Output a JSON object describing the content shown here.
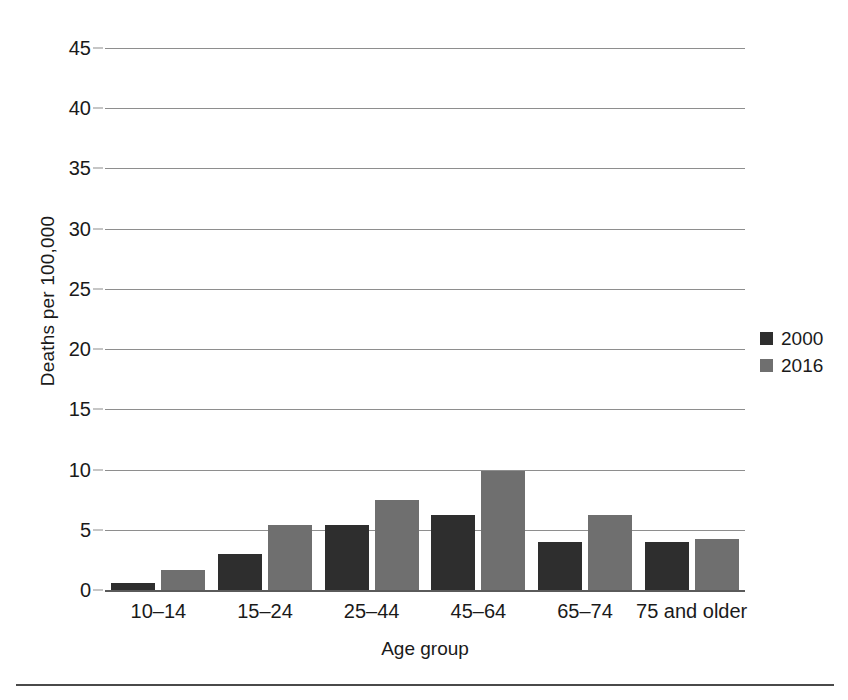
{
  "chart_data": {
    "type": "bar",
    "title": "",
    "xlabel": "Age group",
    "ylabel": "Deaths per 100,000",
    "categories": [
      "10–14",
      "15–24",
      "25–44",
      "45–64",
      "65–74",
      "75 and older"
    ],
    "series": [
      {
        "name": "2000",
        "color": "#2e2e2e",
        "values": [
          0.6,
          3.0,
          5.4,
          6.2,
          4.0,
          4.0
        ]
      },
      {
        "name": "2016",
        "color": "#6f6f6f",
        "values": [
          1.7,
          5.4,
          7.5,
          9.9,
          6.2,
          4.2
        ]
      }
    ],
    "ylim": [
      0,
      45
    ],
    "ytick_values": [
      0,
      5,
      10,
      15,
      20,
      25,
      30,
      35,
      40,
      45
    ],
    "ytick_labels": [
      "0",
      "5",
      "10",
      "15",
      "20",
      "25",
      "30",
      "35",
      "40",
      "45"
    ],
    "grid": true,
    "grid_axis": "y",
    "legend_position": "right",
    "legend_entries": [
      "2000",
      "2016"
    ]
  },
  "figure": {
    "background_color": "#ffffff",
    "gridline_color": "#8e8e8e",
    "axis_color": "#5a5a5a",
    "text_color": "#1a1a1a",
    "bottom_rule_color": "#4a4a4a"
  }
}
